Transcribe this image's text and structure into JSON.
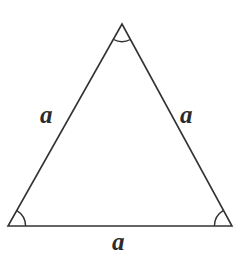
{
  "figure": {
    "name": "equilateral-triangle",
    "background_color": "#ffffff",
    "stroke_color": "#333333",
    "label_color": "#2b2b2b",
    "stroke_width": 1.6
  },
  "labels": {
    "left_side": "a",
    "right_side": "a",
    "base_side": "a"
  },
  "geometry": {
    "apex": {
      "x": 122,
      "y": 24
    },
    "bottom_left": {
      "x": 8,
      "y": 226
    },
    "bottom_right": {
      "x": 232,
      "y": 226
    },
    "polygon_points": "122,24 232,226 8,226",
    "angle_arcs": [
      {
        "name": "apex-angle-arc",
        "path": "M 113.6 39.5 A 18 18 0 0 0 130.4 39.5"
      },
      {
        "name": "bottom-left-angle-arc",
        "path": "M 25.6 226 A 18 18 0 0 0 16.9 210.6"
      },
      {
        "name": "bottom-right-angle-arc",
        "path": "M 223.1 210.6 A 18 18 0 0 0 214.4 226"
      }
    ]
  }
}
